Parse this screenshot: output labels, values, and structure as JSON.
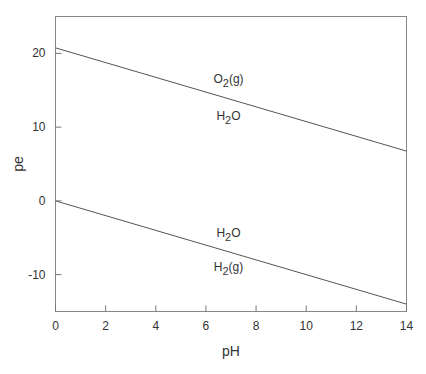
{
  "chart_data": {
    "type": "line",
    "title": "",
    "xlabel": "pH",
    "ylabel": "pe",
    "xlim": [
      0,
      14
    ],
    "ylim": [
      -15,
      25
    ],
    "x_ticks": [
      0,
      2,
      4,
      6,
      8,
      10,
      12,
      14
    ],
    "x_tick_labels": [
      "0",
      "2",
      "4",
      "6",
      "8",
      "10",
      "12",
      "14"
    ],
    "y_ticks": [
      -10,
      0,
      10,
      20
    ],
    "y_tick_labels": [
      "-10",
      "0",
      "10",
      "20"
    ],
    "grid": false,
    "legend": "none",
    "series": [
      {
        "name": "O2(g)/H2O boundary",
        "x": [
          0,
          14
        ],
        "y": [
          20.75,
          6.75
        ]
      },
      {
        "name": "H2O/H2(g) boundary",
        "x": [
          0,
          14
        ],
        "y": [
          0,
          -14
        ]
      }
    ],
    "annotations": [
      {
        "text": "O2(g)",
        "main": "O",
        "sub": "2",
        "suffix": "(g)",
        "x": 6.9,
        "y": 16.5
      },
      {
        "text": "H2O",
        "main": "H",
        "sub": "2",
        "suffix": "O",
        "x": 6.9,
        "y": 11.5
      },
      {
        "text": "H2O",
        "main": "H",
        "sub": "2",
        "suffix": "O",
        "x": 6.9,
        "y": -4.3
      },
      {
        "text": "H2(g)",
        "main": "H",
        "sub": "2",
        "suffix": "(g)",
        "x": 6.9,
        "y": -9.0
      }
    ]
  },
  "colors": {
    "line": "#555555",
    "axis": "#777777",
    "text": "#333333"
  }
}
